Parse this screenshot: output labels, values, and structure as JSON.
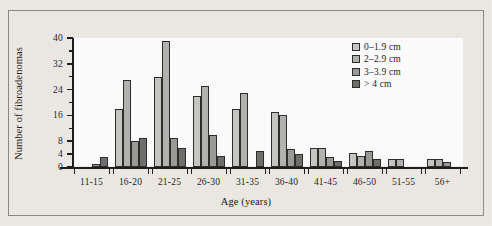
{
  "chart_data": {
    "type": "bar",
    "title": "",
    "subtitle": "",
    "xlabel": "Age (years)",
    "ylabel": "Number of fibroadenomas",
    "categories": [
      "11-15",
      "16-20",
      "21-25",
      "26-30",
      "31-35",
      "36-40",
      "41-45",
      "46-50",
      "51-55",
      "56+"
    ],
    "series": [
      {
        "name": "0–1.9 cm",
        "color": "#c8c8c4",
        "values": [
          0,
          18,
          28,
          22,
          18,
          17,
          6,
          4.5,
          2.5,
          2.5
        ]
      },
      {
        "name": "2–2.9 cm",
        "color": "#b4b4b0",
        "values": [
          0,
          27,
          39,
          25,
          23,
          16,
          6,
          3.5,
          2.5,
          2.5
        ]
      },
      {
        "name": "3–3.9 cm",
        "color": "#9a9a96",
        "values": [
          1,
          8,
          9,
          10,
          0,
          5.5,
          3,
          5,
          0,
          1.5
        ]
      },
      {
        "name": "> 4 cm",
        "color": "#6e6e6a",
        "values": [
          3,
          9,
          6,
          3.5,
          5,
          4,
          2,
          2.5,
          0,
          0
        ]
      }
    ],
    "ylim": [
      0,
      40
    ],
    "yticks": [
      0,
      4,
      8,
      16,
      24,
      32,
      40
    ],
    "ytick_labels": [
      "0",
      "4",
      "8",
      "16",
      "24",
      "32",
      "40"
    ],
    "y_minor_ticks": [
      12,
      20,
      28,
      36
    ],
    "grid": false,
    "legend_position": "top-right",
    "legend_entries": [
      "0–1.9 cm",
      "2–2.9 cm",
      "3–3.9 cm",
      "> 4 cm"
    ],
    "bar_grouping": "clustered",
    "axis_color": "#1d1d1d",
    "plot_background": "#ffffff",
    "page_background": "#efece7"
  }
}
